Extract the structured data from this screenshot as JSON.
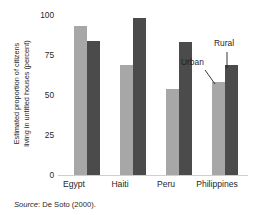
{
  "chart_data": {
    "type": "bar",
    "title": "",
    "subtitle": "",
    "xlabel": "",
    "ylabel": "Estimated proportion of citizens\nliving in untitled houses (percent)",
    "categories": [
      "Egypt",
      "Haiti",
      "Peru",
      "Philippines"
    ],
    "series": [
      {
        "name": "Urban",
        "color": "#a7a7a7",
        "values": [
          93,
          69,
          54,
          58
        ]
      },
      {
        "name": "Rural",
        "color": "#4b4b4b",
        "values": [
          84,
          98,
          83,
          69
        ]
      }
    ],
    "ylim": [
      0,
      100
    ],
    "yticks": [
      0,
      25,
      50,
      75,
      100
    ],
    "ytick_labels": [
      "0",
      "25",
      "50",
      "75",
      "100"
    ],
    "grid": false,
    "legend": "annotated-callouts",
    "annotations": [
      {
        "label": "Urban",
        "points_to": "Philippines urban bar"
      },
      {
        "label": "Rural",
        "points_to": "Philippines rural bar"
      }
    ]
  },
  "source_note": {
    "label": "Source",
    "separator": ": ",
    "text": "De Soto (2000)."
  }
}
